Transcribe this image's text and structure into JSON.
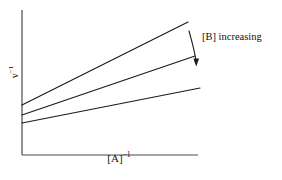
{
  "figure": {
    "name": "double-reciprocal-plot",
    "background_color": "#ffffff",
    "line_color": "#1a1a1a",
    "axis_color": "#4a4a4a"
  },
  "axes": {
    "xlabel_text": "[A]",
    "xlabel_exponent": "−1",
    "ylabel_text": "v",
    "ylabel_exponent": "−1"
  },
  "annotation": {
    "text": "[B] increasing",
    "arrow_name": "down-arrow-icon"
  },
  "chart_data": {
    "type": "line",
    "title": "",
    "xlabel": "[A]⁻¹",
    "ylabel": "v⁻¹",
    "grid": false,
    "legend": null,
    "axis_pixel_frame": {
      "x_origin": 22,
      "y_origin": 155,
      "x_end": 198,
      "y_top": 10
    },
    "xlim": [
      0,
      1
    ],
    "ylim": [
      0,
      1
    ],
    "annotations": [
      {
        "text": "[B] increasing",
        "arrow": "downward",
        "meaning": "slope and intercept decrease as [B] increases"
      }
    ],
    "series": [
      {
        "name": "lowest [B]",
        "description": "steepest slope, highest y-intercept",
        "x": [
          0.0,
          0.94
        ],
        "y": [
          0.345,
          0.918
        ],
        "pixel_points": [
          [
            22,
            105
          ],
          [
            188,
            22
          ]
        ],
        "slope_relative": 3.0,
        "intercept_relative": 0.345
      },
      {
        "name": "intermediate [B]",
        "description": "middle slope, middle y-intercept",
        "x": [
          0.0,
          0.98
        ],
        "y": [
          0.276,
          0.683
        ],
        "pixel_points": [
          [
            22,
            115
          ],
          [
            195,
            56
          ]
        ],
        "slope_relative": 1.95,
        "intercept_relative": 0.276
      },
      {
        "name": "highest [B]",
        "description": "shallowest slope, lowest y-intercept",
        "x": [
          0.0,
          1.0
        ],
        "y": [
          0.221,
          0.462
        ],
        "pixel_points": [
          [
            22,
            123
          ],
          [
            200,
            88
          ]
        ],
        "slope_relative": 1.0,
        "intercept_relative": 0.221
      }
    ]
  }
}
